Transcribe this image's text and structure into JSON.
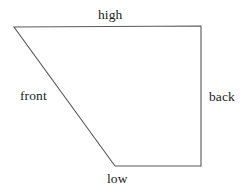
{
  "diagram": {
    "background_color": "#ffffff",
    "stroke_color": "#5a5a5a",
    "text_color": "#1c1c1c",
    "canvas": {
      "width": 252,
      "height": 194
    },
    "shape": {
      "type": "quadrilateral",
      "closed": true,
      "vertices": [
        {
          "name": "top-left",
          "x": 14,
          "y": 27
        },
        {
          "name": "top-right",
          "x": 201,
          "y": 26
        },
        {
          "name": "bottom-right",
          "x": 201,
          "y": 166
        },
        {
          "name": "bottom-left",
          "x": 115,
          "y": 166
        }
      ],
      "path": "M 14 27 L 201 26 L 201 166 L 115 166 Z"
    },
    "edges": [
      {
        "name": "top-edge",
        "label_ref": "high",
        "from": "top-left",
        "to": "top-right"
      },
      {
        "name": "right-edge",
        "label_ref": "back",
        "from": "top-right",
        "to": "bottom-right"
      },
      {
        "name": "bottom-edge",
        "label_ref": "low",
        "from": "bottom-right",
        "to": "bottom-left"
      },
      {
        "name": "left-slanted-edge",
        "label_ref": "front",
        "from": "bottom-left",
        "to": "top-left"
      }
    ],
    "labels": {
      "high": "high",
      "front": "front",
      "back": "back",
      "low": "low"
    }
  }
}
